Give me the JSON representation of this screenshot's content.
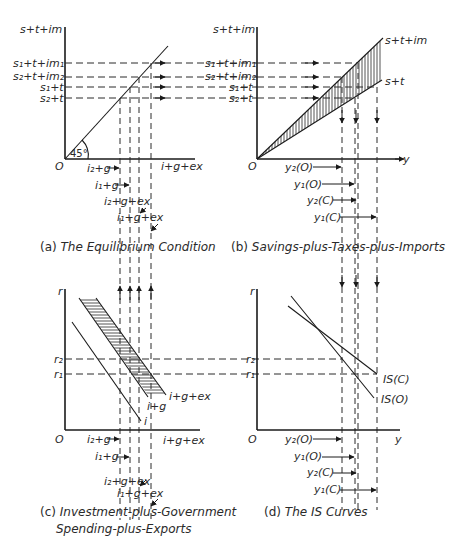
{
  "figure": {
    "panels": [
      {
        "id": "a",
        "caption_prefix": "(a)",
        "caption": "The Equilibrium Condition",
        "y_axis_label": "s+t+im",
        "x_axis_label": "i+g+ex",
        "origin": "O",
        "angle_label": "45°",
        "y_ticks": [
          "s1+t+im1",
          "s2+t+im2",
          "s1+t",
          "s2+t"
        ],
        "x_ticks": [
          "i2+g",
          "i1+g",
          "i2+g+ex",
          "i1+g+ex"
        ]
      },
      {
        "id": "b",
        "caption_prefix": "(b)",
        "caption": "Savings-plus-Taxes-plus-Imports",
        "y_axis_label": "s+t+im",
        "x_axis_label": "y",
        "origin": "O",
        "curves": [
          "s+t+im",
          "s+t"
        ],
        "y_ticks": [
          "s1+t+im1",
          "s2+t+im2",
          "s1+t",
          "s2+t"
        ],
        "x_ticks": [
          "y2(O)",
          "y1(O)",
          "y2(C)",
          "y1(C)"
        ]
      },
      {
        "id": "c",
        "caption_prefix": "(c)",
        "caption": "Investment-plus-Government",
        "caption_line2": "Spending-plus-Exports",
        "y_axis_label": "r",
        "x_axis_label": "i+g+ex",
        "origin": "O",
        "curves": [
          "i+g+ex",
          "i+g",
          "i"
        ],
        "y_ticks": [
          "r2",
          "r1"
        ],
        "x_ticks": [
          "i2+g",
          "i1+g",
          "i2+g+ex",
          "i1+g+ex"
        ]
      },
      {
        "id": "d",
        "caption_prefix": "(d)",
        "caption": "The IS Curves",
        "y_axis_label": "r",
        "x_axis_label": "y",
        "origin": "O",
        "curves": [
          "IS(C)",
          "IS(O)"
        ],
        "y_ticks": [
          "r2",
          "r1"
        ],
        "x_ticks": [
          "y2(O)",
          "y1(O)",
          "y2(C)",
          "y1(C)"
        ]
      }
    ]
  },
  "labels": {
    "a_y": "s+t+im",
    "a_x": "i+g+ex",
    "a_O": "O",
    "a_angle": "45°",
    "s1tim1": "s₁+t+im₁",
    "s2tim2": "s₂+t+im₂",
    "s1t": "s₁+t",
    "s2t": "s₂+t",
    "i2g": "i₂+g",
    "i1g": "i₁+g",
    "i2gex": "i₂+g+ex",
    "i1gex": "i₁+g+ex",
    "b_y": "s+t+im",
    "b_x": "y",
    "b_O": "O",
    "b_curve1": "s+t+im",
    "b_curve2": "s+t",
    "y2O": "y₂(O)",
    "y1O": "y₁(O)",
    "y2C": "y₂(C)",
    "y1C": "y₁(C)",
    "c_y": "r",
    "c_x": "i+g+ex",
    "c_O": "O",
    "c_curve1": "i+g+ex",
    "c_curve2": "i+g",
    "c_curve3": "i",
    "r2": "r₂",
    "r1": "r₁",
    "d_y": "r",
    "d_x": "y",
    "d_O": "O",
    "ISC": "IS(C)",
    "ISO": "IS(O)",
    "cap_a_pre": "(a) ",
    "cap_a": "The Equilibrium Condition",
    "cap_b_pre": "(b) ",
    "cap_b": "Savings-plus-Taxes-plus-Imports",
    "cap_c_pre": "(c) ",
    "cap_c": "Investment-plus-Government",
    "cap_c2": "Spending-plus-Exports",
    "cap_d_pre": "(d) ",
    "cap_d": "The IS Curves"
  }
}
